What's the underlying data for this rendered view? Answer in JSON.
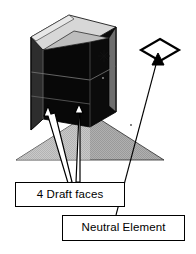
{
  "diagram": {
    "type": "isometric-cad-illustration",
    "callouts": [
      {
        "id": "draft-faces",
        "label": "4 Draft faces",
        "box": {
          "x": 15,
          "y": 182,
          "width": 110,
          "height": 25
        },
        "pointer_count": 2,
        "pointer_style": "white-filled-arrow-black-outline"
      },
      {
        "id": "neutral-element",
        "label": "Neutral Element",
        "box": {
          "x": 62,
          "y": 215,
          "width": 123,
          "height": 26
        },
        "pointer_count": 1,
        "pointer_style": "thin-black-line-solid-arrowhead"
      }
    ],
    "markers": [
      {
        "id": "neutral-element-diamond",
        "shape": "diamond-outline",
        "center_x": 160,
        "center_y": 50,
        "width": 38,
        "height": 21
      }
    ],
    "solid": {
      "name": "drafted-pocket-block",
      "top_rim_color": "#d9d9d9",
      "body_color": "#0a0a0a",
      "side_color": "#3a3a3a",
      "ground_plane_color": "#a8a8a8",
      "outline_color": "#000000"
    },
    "colors": {
      "background": "#ffffff",
      "ink": "#000000",
      "light_gray": "#d9d9d9",
      "mid_gray": "#a8a8a8",
      "dark": "#0a0a0a",
      "arrow_fill": "#ffffff"
    }
  }
}
